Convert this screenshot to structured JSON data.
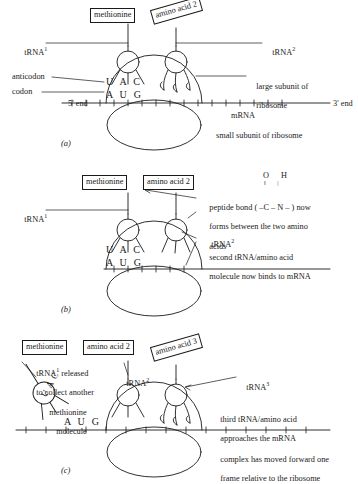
{
  "figure": {
    "ink_color": "#1a1a1a",
    "background_color": "#ffffff"
  },
  "panel_a": {
    "label": "(a)",
    "boxes": {
      "methionine": "methionine",
      "amino_acid_2": "amino acid 2"
    },
    "labels": {
      "trna1": "tRNA",
      "trna1_sup": "1",
      "trna2": "tRNA",
      "trna2_sup": "2",
      "anticodon": "anticodon",
      "codon": "codon",
      "five_end": "5' end",
      "three_end": "3' end",
      "mrna": "mRNA",
      "large_subunit_line1": "large subunit of",
      "large_subunit_line2": "ribosome",
      "small_subunit": "small subunit of ribosome"
    },
    "sequences": {
      "anticodon_bases": "U A C",
      "codon_bases": "A U G"
    }
  },
  "panel_b": {
    "label": "(b)",
    "boxes": {
      "methionine": "methionine",
      "amino_acid_2": "amino acid 2"
    },
    "labels": {
      "trna1": "tRNA",
      "trna1_sup": "1",
      "trna2": "tRNA",
      "trna2_sup": "2",
      "peptide_line1": "peptide bond ( –C – N – ) now",
      "peptide_line2": "forms between the two amino",
      "peptide_line3": "acids",
      "second_trna_line1": "second tRNA/amino acid",
      "second_trna_line2": "molecule now binds to mRNA"
    },
    "formula": {
      "atoms_top": "O  H",
      "bonds": "‖   |"
    },
    "sequences": {
      "anticodon_bases": "U A C",
      "codon_bases": "A U G"
    }
  },
  "panel_c": {
    "label": "(c)",
    "boxes": {
      "methionine": "methionine",
      "amino_acid_2": "amino acid 2",
      "amino_acid_3": "amino acid 3"
    },
    "labels": {
      "released_line1": "tRNA",
      "released_sup": "1",
      "released_line1_rest": " released",
      "released_line2": "to collect another",
      "released_line3": "methionine",
      "released_line4": "molecule",
      "trna2": "tRNA",
      "trna2_sup": "2",
      "trna3": "tRNA",
      "trna3_sup": "3",
      "third_trna_line1": "third tRNA/amino acid",
      "third_trna_line2": "approaches the mRNA",
      "moved_line1": "complex has moved forward one",
      "moved_line2": "frame relative to the ribosome"
    },
    "sequences": {
      "released_bases": "U A C",
      "codon_bases": "A U G"
    }
  }
}
